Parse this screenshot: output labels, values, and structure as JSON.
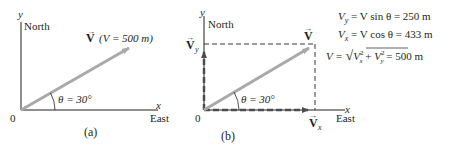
{
  "colors": {
    "vector": "#a7a9ac",
    "axis": "#231f20",
    "text": "#231f20",
    "dashed": "#4d4d4f"
  },
  "panel_a": {
    "y_axis_label": "y",
    "north_label": "North",
    "x_axis_label": "x",
    "east_label": "East",
    "origin_label": "0",
    "vector_symbol": "V",
    "vector_magnitude": "(V = 500 m)",
    "angle_label": "θ = 30°",
    "caption": "(a)"
  },
  "panel_b": {
    "y_axis_label": "y",
    "north_label": "North",
    "x_axis_label": "x",
    "east_label": "East",
    "origin_label": "0",
    "vector_symbol": "V",
    "vy_symbol": "V",
    "vy_subscript": "y",
    "vx_symbol": "V",
    "vx_subscript": "x",
    "angle_label": "θ = 30°",
    "caption": "(b)"
  },
  "equations": [
    {
      "lhs": "V",
      "sub": "y",
      "rhs": " = V sin θ = 250 m"
    },
    {
      "lhs": "V",
      "sub": "x",
      "rhs": " = V cos θ = 433 m"
    },
    {
      "lhs": "V = √",
      "rhs": " = 500 m"
    }
  ],
  "eq3_parts": {
    "prefix": "V = ",
    "vx2": "V",
    "vx2_sub": "x",
    "plus": " + ",
    "vy2": "V",
    "vy2_sub": "y",
    "sup": "2",
    "suffix": " = 500 m"
  }
}
